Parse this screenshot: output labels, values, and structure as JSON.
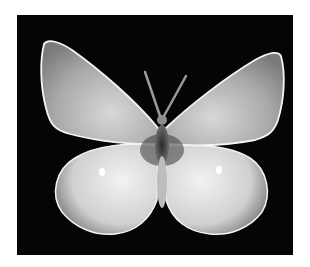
{
  "image": {
    "subject": "butterfly",
    "description": "Black-and-white photograph of a pale butterfly with wings spread, on a black background",
    "colors": {
      "background": "#050505",
      "page": "#ffffff",
      "wing_light": "#e8e8e8",
      "wing_dark": "#8a8a8a",
      "wing_edge": "#f4f4f4",
      "body": "#3a3a3a"
    }
  }
}
